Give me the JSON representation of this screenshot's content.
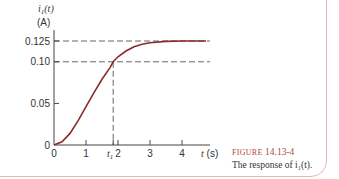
{
  "chart_data": {
    "type": "line",
    "title": "",
    "ylabel": "i1(t)",
    "yunit": "(A)",
    "xlabel": "t (s)",
    "xlim": [
      0,
      5
    ],
    "ylim": [
      0,
      0.13
    ],
    "yticks": [
      0,
      0.05,
      0.1,
      0.125
    ],
    "ytick_labels": [
      "0",
      "0.05",
      "0.10",
      "0.125"
    ],
    "xticks": [
      0,
      1,
      2,
      3,
      4
    ],
    "xtick_labels": [
      "0",
      "1",
      "2",
      "3",
      "4"
    ],
    "marker_t1": 1.85,
    "marker_t1_label": "t1",
    "dashed_levels": [
      0.125,
      0.1
    ],
    "series": [
      {
        "name": "i1(t)",
        "color": "#8b2a2a",
        "x": [
          0,
          0.25,
          0.5,
          0.75,
          1.0,
          1.25,
          1.5,
          1.75,
          1.85,
          2.0,
          2.25,
          2.5,
          2.75,
          3.0,
          3.5,
          4.0,
          4.5,
          4.75
        ],
        "y": [
          0,
          0.004,
          0.014,
          0.029,
          0.046,
          0.063,
          0.079,
          0.093,
          0.1,
          0.106,
          0.113,
          0.118,
          0.121,
          0.123,
          0.1245,
          0.125,
          0.125,
          0.125
        ]
      }
    ],
    "grid": false
  },
  "caption": {
    "figure_word": "FIGURE",
    "figure_number": "14.13-4",
    "text": "The response of i₁(t)."
  },
  "colors": {
    "curve": "#8b2a2a",
    "axis": "#444444",
    "frame": "#e8b8b0",
    "caption_accent": "#b04a3a"
  }
}
